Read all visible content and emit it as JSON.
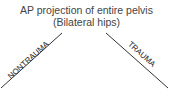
{
  "diagram": {
    "root": {
      "line1": "AP projection of entire pelvis",
      "line2": "(Bilateral hips)"
    },
    "branches": [
      {
        "label": "NONTRAUMA",
        "direction": "left"
      },
      {
        "label": "TRAUMA",
        "direction": "right"
      }
    ],
    "colors": {
      "line": "#333333",
      "text": "#444444"
    }
  }
}
